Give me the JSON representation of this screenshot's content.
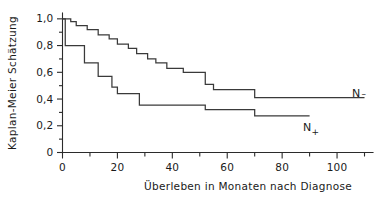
{
  "chart_data": {
    "type": "line",
    "subtype": "kaplan-meier-step",
    "title": "",
    "xlabel": "Überleben in Monaten nach Diagnose",
    "ylabel": "Kaplan-Meier  Schätzung",
    "xlim": [
      0,
      112
    ],
    "ylim": [
      0,
      1.04
    ],
    "grid": false,
    "legend_position": "right-inline",
    "xticks": [
      0,
      20,
      40,
      60,
      80,
      100
    ],
    "xtick_labels": [
      "0",
      "20",
      "40",
      "60",
      "80",
      "100"
    ],
    "xminor_ticks": [
      10,
      30,
      50,
      70,
      90,
      110
    ],
    "yticks": [
      0,
      0.2,
      0.4,
      0.6,
      0.8,
      1.0
    ],
    "ytick_labels": [
      "0",
      "0,2",
      "0,4",
      "0,6",
      "0,8",
      "1,0"
    ],
    "yminor_ticks": [
      0.1,
      0.3,
      0.5,
      0.7,
      0.9
    ],
    "series": [
      {
        "name": "N−",
        "label": "N−",
        "label_main": "N",
        "label_sub": "−",
        "color": "#3a3a3a",
        "steps": [
          [
            0,
            1.0
          ],
          [
            3,
            1.0
          ],
          [
            3,
            0.98
          ],
          [
            5,
            0.98
          ],
          [
            5,
            0.95
          ],
          [
            9,
            0.95
          ],
          [
            9,
            0.92
          ],
          [
            13,
            0.92
          ],
          [
            13,
            0.88
          ],
          [
            17,
            0.88
          ],
          [
            17,
            0.85
          ],
          [
            20,
            0.85
          ],
          [
            20,
            0.81
          ],
          [
            24,
            0.81
          ],
          [
            24,
            0.78
          ],
          [
            27,
            0.78
          ],
          [
            27,
            0.74
          ],
          [
            31,
            0.74
          ],
          [
            31,
            0.7
          ],
          [
            34,
            0.7
          ],
          [
            34,
            0.67
          ],
          [
            38,
            0.67
          ],
          [
            38,
            0.63
          ],
          [
            44,
            0.63
          ],
          [
            44,
            0.6
          ],
          [
            52,
            0.6
          ],
          [
            52,
            0.51
          ],
          [
            55,
            0.51
          ],
          [
            55,
            0.47
          ],
          [
            70,
            0.47
          ],
          [
            70,
            0.41
          ],
          [
            110,
            0.41
          ]
        ]
      },
      {
        "name": "N+",
        "label": "N+",
        "label_main": "N",
        "label_sub": "+",
        "color": "#3a3a3a",
        "steps": [
          [
            0,
            1.0
          ],
          [
            1,
            1.0
          ],
          [
            1,
            0.8
          ],
          [
            8,
            0.8
          ],
          [
            8,
            0.67
          ],
          [
            13,
            0.67
          ],
          [
            13,
            0.57
          ],
          [
            18,
            0.57
          ],
          [
            18,
            0.49
          ],
          [
            20,
            0.49
          ],
          [
            20,
            0.44
          ],
          [
            28,
            0.44
          ],
          [
            28,
            0.355
          ],
          [
            52,
            0.355
          ],
          [
            52,
            0.32
          ],
          [
            70,
            0.32
          ],
          [
            70,
            0.275
          ],
          [
            90,
            0.275
          ]
        ]
      }
    ]
  },
  "labels": {
    "y_axis_title": "Kaplan-Meier  Schätzung",
    "x_axis_title": "Überleben in Monaten nach Diagnose",
    "series_n_minus_main": "N",
    "series_n_minus_sub": "–",
    "series_n_plus_main": "N",
    "series_n_plus_sub": "+"
  }
}
